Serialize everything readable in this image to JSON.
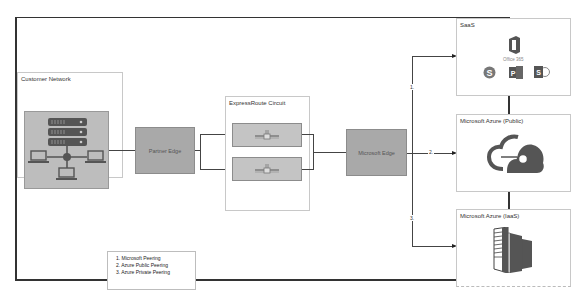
{
  "diagram": {
    "title_fragment": "",
    "customer_network": {
      "label": "Customer Network",
      "icon": "network-servers-laptops-icon"
    },
    "partner_edge": {
      "label": "Partner Edge"
    },
    "expressroute": {
      "label": "ExpressRoute Circuit",
      "connections": [
        {
          "icon": "pipe-connector-icon"
        },
        {
          "icon": "pipe-connector-icon"
        }
      ]
    },
    "microsoft_edge": {
      "label": "Microsoft Edge"
    },
    "destinations": [
      {
        "label": "SaaS",
        "icons": [
          "office-365-icon",
          "skype-icon",
          "project-icon",
          "sharepoint-icon"
        ],
        "sublabel": "Office 365",
        "route_label": "1."
      },
      {
        "label": "Microsoft Azure (Public)",
        "icons": [
          "azure-cloud-icon"
        ],
        "route_label": "2."
      },
      {
        "label": "Microsoft Azure (IaaS)",
        "icons": [
          "server-rack-icon"
        ],
        "route_label": "3."
      }
    ],
    "legend": {
      "items": [
        "1. Microsoft Peering",
        "2. Azure Public Peering",
        "3. Azure Private Peering"
      ]
    },
    "colors": {
      "box_grey": "#a9a9a9",
      "icon_grey": "#5a5a5a",
      "line": "#444444",
      "panel_border": "#c8c8c8"
    }
  }
}
